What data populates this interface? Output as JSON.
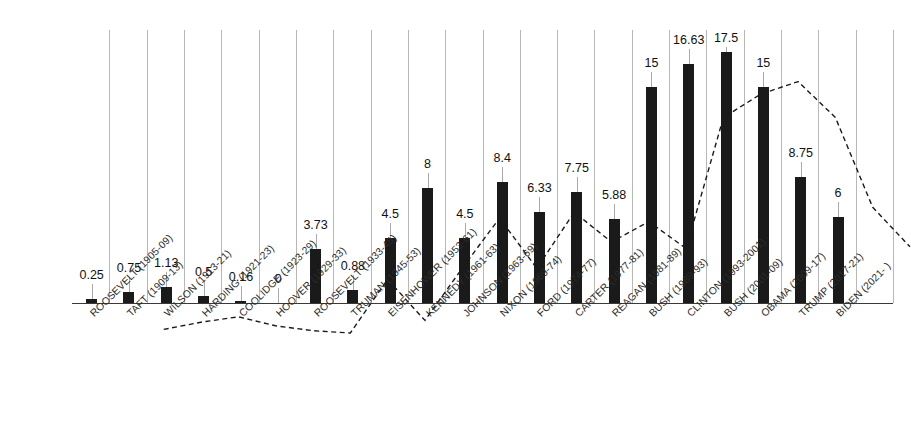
{
  "chart_data": {
    "type": "bar",
    "title": "",
    "subtitle": "",
    "xlabel": "",
    "ylabel": "",
    "ylim": [
      0,
      19
    ],
    "grid": "vertical-category-separators",
    "legend": "none",
    "bar_color": "#1a1a1a",
    "line_color": "#1a1a1a",
    "gridline_color": "#b7b7b7",
    "axis_color": "#3a3a3a",
    "categories": [
      "ROOSEVELT (1905-09)",
      "TAFT (1909-13)",
      "WILSON (1913-21)",
      "HARDING (1921-23)",
      "COOLIDGE (1923-29)",
      "HOOVER (1929-33)",
      "ROOSEVELT (1933-45)",
      "TRUMAN (1945-53)",
      "EISENHOWER (1953-61)",
      "KENNEDY (1961-63)",
      "JOHNSON (1963-69)",
      "NIXON (1969-74)",
      "FORD (1974-77)",
      "CARTER (1977-81)",
      "REAGAN (1981-89)",
      "BUSH (1989-93)",
      "CLINTON (1993-2001)",
      "BUSH (2001-09)",
      "OBAMA (2009-17)",
      "TRUMP (2017-21)",
      "BIDEN (2021- )"
    ],
    "values": [
      0.25,
      0.75,
      1.13,
      0.5,
      0.16,
      0,
      3.73,
      0.88,
      4.5,
      8,
      4.5,
      8.4,
      6.33,
      7.75,
      5.88,
      15,
      16.63,
      17.5,
      15,
      8.75,
      6
    ],
    "value_labels": [
      "0.25",
      "0.75",
      "1.13",
      "0.5",
      "0.16",
      "0",
      "3.73",
      "0.88",
      "4.5",
      "8",
      "4.5",
      "8.4",
      "6.33",
      "7.75",
      "5.88",
      "15",
      "16.63",
      "17.5",
      "15",
      "8.75",
      "6"
    ],
    "series": [
      {
        "name": "bars",
        "type": "bar",
        "values": [
          0.25,
          0.75,
          1.13,
          0.5,
          0.16,
          0,
          3.73,
          0.88,
          4.5,
          8,
          4.5,
          8.4,
          6.33,
          7.75,
          5.88,
          15,
          16.63,
          17.5,
          15,
          8.75,
          6
        ]
      },
      {
        "name": "trend",
        "type": "line",
        "style": "dashed",
        "values": [
          0.25,
          0.75,
          1.13,
          0.5,
          0.16,
          0,
          3.73,
          0.88,
          4.5,
          8,
          4.5,
          8.4,
          6.33,
          7.75,
          5.88,
          15,
          16.63,
          17.5,
          15,
          8.75,
          6
        ]
      }
    ]
  },
  "watermark": ""
}
